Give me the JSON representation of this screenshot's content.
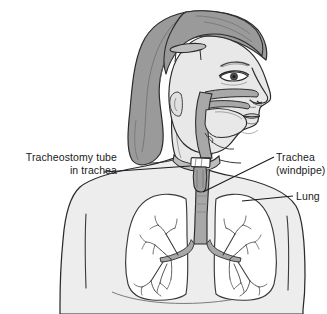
{
  "figure": {
    "background_color": "#ffffff",
    "line_color": "#2b2b2b",
    "colors": {
      "hair": "#9a9a9a",
      "skin": "#e8e8e8",
      "airway": "#a8a8a8",
      "trachea": "#a8a8a8",
      "body": "#ededed",
      "lung_fill": "#ffffff",
      "tube_plate": "#ffffff",
      "text": "#1a1a1a"
    }
  },
  "labels": {
    "tracheostomy": {
      "line1": "Tracheostomy tube",
      "line2": "in trachea"
    },
    "trachea": {
      "line1": "Trachea",
      "line2": "(windpipe)"
    },
    "lung": {
      "line1": "Lung"
    }
  },
  "parts": {
    "head": "head-profile",
    "hair": "hair",
    "hair_clip": "barrette",
    "eye": "eye",
    "nose": "nose",
    "mouth": "mouth",
    "ear": "ear",
    "nasal_airway": "nasal-airway-cutaway",
    "tongue": "tongue",
    "pharynx": "pharynx",
    "trach_tube": "tracheostomy-tube",
    "neck_strap": "tracheostomy-neck-strap",
    "trachea": "trachea",
    "carina": "carina",
    "bronchi": "bronchial-tree",
    "left_lung": "left-lung",
    "right_lung": "right-lung",
    "torso": "torso"
  },
  "leader_lines": {
    "tracheostomy": "leader-line-tracheostomy",
    "trachea": "leader-line-trachea",
    "lung": "leader-line-lung"
  }
}
